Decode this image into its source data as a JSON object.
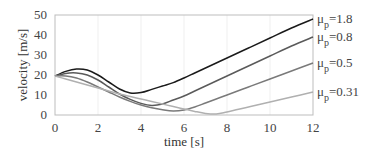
{
  "chart_data": {
    "type": "line",
    "title": "",
    "xlabel": "time [s]",
    "ylabel": "velocity [m/s]",
    "xlim": [
      0,
      12
    ],
    "ylim": [
      0,
      50
    ],
    "xticks": [
      0,
      2,
      4,
      6,
      8,
      10,
      12
    ],
    "yticks": [
      0,
      10,
      20,
      30,
      40,
      50
    ],
    "grid": true,
    "legend_position": "right-inline",
    "x": [
      0,
      0.5,
      1,
      1.5,
      2,
      2.5,
      3,
      3.5,
      4,
      4.5,
      5,
      5.5,
      6,
      6.5,
      7,
      7.5,
      8,
      9,
      10,
      11,
      12
    ],
    "series": [
      {
        "name": "μp=1.8",
        "label_sub": "p",
        "label_value": "=1.8",
        "color": "#1a1a1a",
        "values": [
          19.5,
          21.8,
          23,
          22.5,
          20,
          16.5,
          13,
          11,
          11.2,
          12.8,
          14.5,
          16.2,
          18.5,
          21,
          23.5,
          26,
          28.5,
          33.5,
          38.5,
          43.5,
          48
        ]
      },
      {
        "name": "μp=0.8",
        "label_sub": "p",
        "label_value": "=0.8",
        "color": "#5a5a5a",
        "values": [
          19.5,
          20.8,
          21,
          20,
          17.5,
          14,
          10.5,
          7.8,
          5.8,
          4.8,
          5.5,
          7.5,
          9.5,
          12,
          14.5,
          17,
          19.5,
          24.5,
          29.5,
          34.5,
          39
        ]
      },
      {
        "name": "μp=0.5",
        "label_sub": "p",
        "label_value": "=0.5",
        "color": "#7a7a7a",
        "values": [
          19.5,
          19.5,
          18.5,
          16.5,
          14,
          11.5,
          9,
          6.8,
          5,
          3.6,
          2.6,
          2,
          2.5,
          4,
          6,
          8,
          10,
          14,
          18,
          22,
          26
        ]
      },
      {
        "name": "μp=0.31",
        "label_sub": "p",
        "label_value": "=0.31",
        "color": "#b0b0b0",
        "values": [
          19.5,
          18,
          16.5,
          15,
          13.5,
          12,
          10.5,
          9.2,
          8,
          6.8,
          5.5,
          4.2,
          3,
          1.8,
          0.8,
          0.5,
          1.5,
          4,
          6.5,
          9,
          11.5
        ]
      }
    ]
  },
  "labels": {
    "mu": "μ"
  }
}
